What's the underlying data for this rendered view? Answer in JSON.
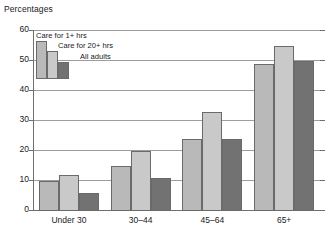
{
  "chart_data": {
    "type": "bar",
    "title": "Percentages",
    "xlabel": "",
    "ylabel": "",
    "categories": [
      "Under 30",
      "30–44",
      "45–64",
      "65+"
    ],
    "series": [
      {
        "name": "Care for 1+ hrs",
        "values": [
          10,
          15,
          24,
          49
        ],
        "color": "#b9b9b9"
      },
      {
        "name": "Care for 20+ hrs",
        "values": [
          12,
          20,
          33,
          55
        ],
        "color": "#c9c9c9"
      },
      {
        "name": "All adults",
        "values": [
          6,
          11,
          24,
          50
        ],
        "color": "#727272"
      }
    ],
    "ylim": [
      0,
      60
    ],
    "yticks": [
      0,
      10,
      20,
      30,
      40,
      50,
      60
    ],
    "ytick_labels": [
      "0",
      "10",
      "20",
      "30",
      "40",
      "50",
      "60"
    ],
    "grid": true,
    "legend_position": "top-left"
  }
}
